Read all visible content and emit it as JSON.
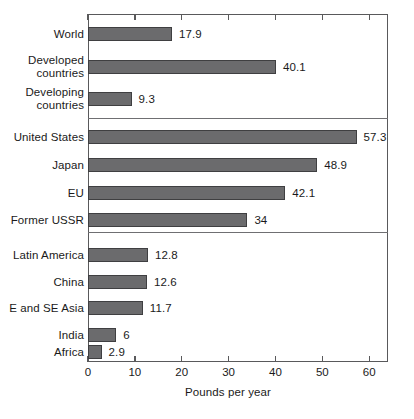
{
  "chart_data": {
    "type": "bar",
    "orientation": "horizontal",
    "title": "",
    "xlabel": "Pounds per year",
    "ylabel": "",
    "xlim": [
      0,
      64
    ],
    "xticks": [
      0,
      10,
      20,
      30,
      40,
      50,
      60
    ],
    "xtick_labels": [
      "0",
      "10",
      "20",
      "30",
      "40",
      "50",
      "60"
    ],
    "grid": false,
    "legend": null,
    "bar_color": "#6b6b6d",
    "bar_edge_color": "#3f3f41",
    "group_separators": true,
    "groups": [
      {
        "name": "aggregates",
        "categories": [
          "World",
          "Developed countries",
          "Developing countries"
        ],
        "values": [
          17.9,
          40.1,
          9.3
        ],
        "value_labels": [
          "17.9",
          "40.1",
          "9.3"
        ]
      },
      {
        "name": "industrialized",
        "categories": [
          "United States",
          "Japan",
          "EU",
          "Former USSR"
        ],
        "values": [
          57.3,
          48.9,
          42.1,
          34
        ],
        "value_labels": [
          "57.3",
          "48.9",
          "42.1",
          "34"
        ]
      },
      {
        "name": "developing-regions",
        "categories": [
          "Latin America",
          "China",
          "E and SE Asia",
          "India",
          "Africa"
        ],
        "values": [
          12.8,
          12.6,
          11.7,
          6,
          2.9
        ],
        "value_labels": [
          "12.8",
          "12.6",
          "11.7",
          "6",
          "2.9"
        ]
      }
    ],
    "categories": [
      "World",
      "Developed countries",
      "Developing countries",
      "United States",
      "Japan",
      "EU",
      "Former USSR",
      "Latin America",
      "China",
      "E and SE Asia",
      "India",
      "Africa"
    ],
    "values": [
      17.9,
      40.1,
      9.3,
      57.3,
      48.9,
      42.1,
      34,
      12.8,
      12.6,
      11.7,
      6,
      2.9
    ]
  },
  "axis": {
    "x_title": "Pounds per year"
  },
  "bars": [
    {
      "label": "World",
      "label_lines": [
        "World"
      ],
      "value": 17.9,
      "value_label": "17.9",
      "top": 27
    },
    {
      "label": "Developed countries",
      "label_lines": [
        "Developed",
        "countries"
      ],
      "value": 40.1,
      "value_label": "40.1",
      "top": 60
    },
    {
      "label": "Developing countries",
      "label_lines": [
        "Developing",
        "countries"
      ],
      "value": 9.3,
      "value_label": "9.3",
      "top": 92
    },
    {
      "label": "United States",
      "label_lines": [
        "United States"
      ],
      "value": 57.3,
      "value_label": "57.3",
      "top": 130
    },
    {
      "label": "Japan",
      "label_lines": [
        "Japan"
      ],
      "value": 48.9,
      "value_label": "48.9",
      "top": 158
    },
    {
      "label": "EU",
      "label_lines": [
        "EU"
      ],
      "value": 42.1,
      "value_label": "42.1",
      "top": 186
    },
    {
      "label": "Former USSR",
      "label_lines": [
        "Former USSR"
      ],
      "value": 34,
      "value_label": "34",
      "top": 213
    },
    {
      "label": "Latin America",
      "label_lines": [
        "Latin America"
      ],
      "value": 12.8,
      "value_label": "12.8",
      "top": 248
    },
    {
      "label": "China",
      "label_lines": [
        "China"
      ],
      "value": 12.6,
      "value_label": "12.6",
      "top": 275
    },
    {
      "label": "E and SE Asia",
      "label_lines": [
        "E and SE Asia"
      ],
      "value": 11.7,
      "value_label": "11.7",
      "top": 301
    },
    {
      "label": "India",
      "label_lines": [
        "India"
      ],
      "value": 6,
      "value_label": "6",
      "top": 328
    },
    {
      "label": "Africa",
      "label_lines": [
        "Africa"
      ],
      "value": 2.9,
      "value_label": "2.9",
      "top": 345
    }
  ],
  "separators": [
    118,
    232
  ],
  "geometry": {
    "plot_left": 88,
    "plot_top": 14,
    "plot_width": 300,
    "plot_height": 348,
    "x_max": 64
  }
}
